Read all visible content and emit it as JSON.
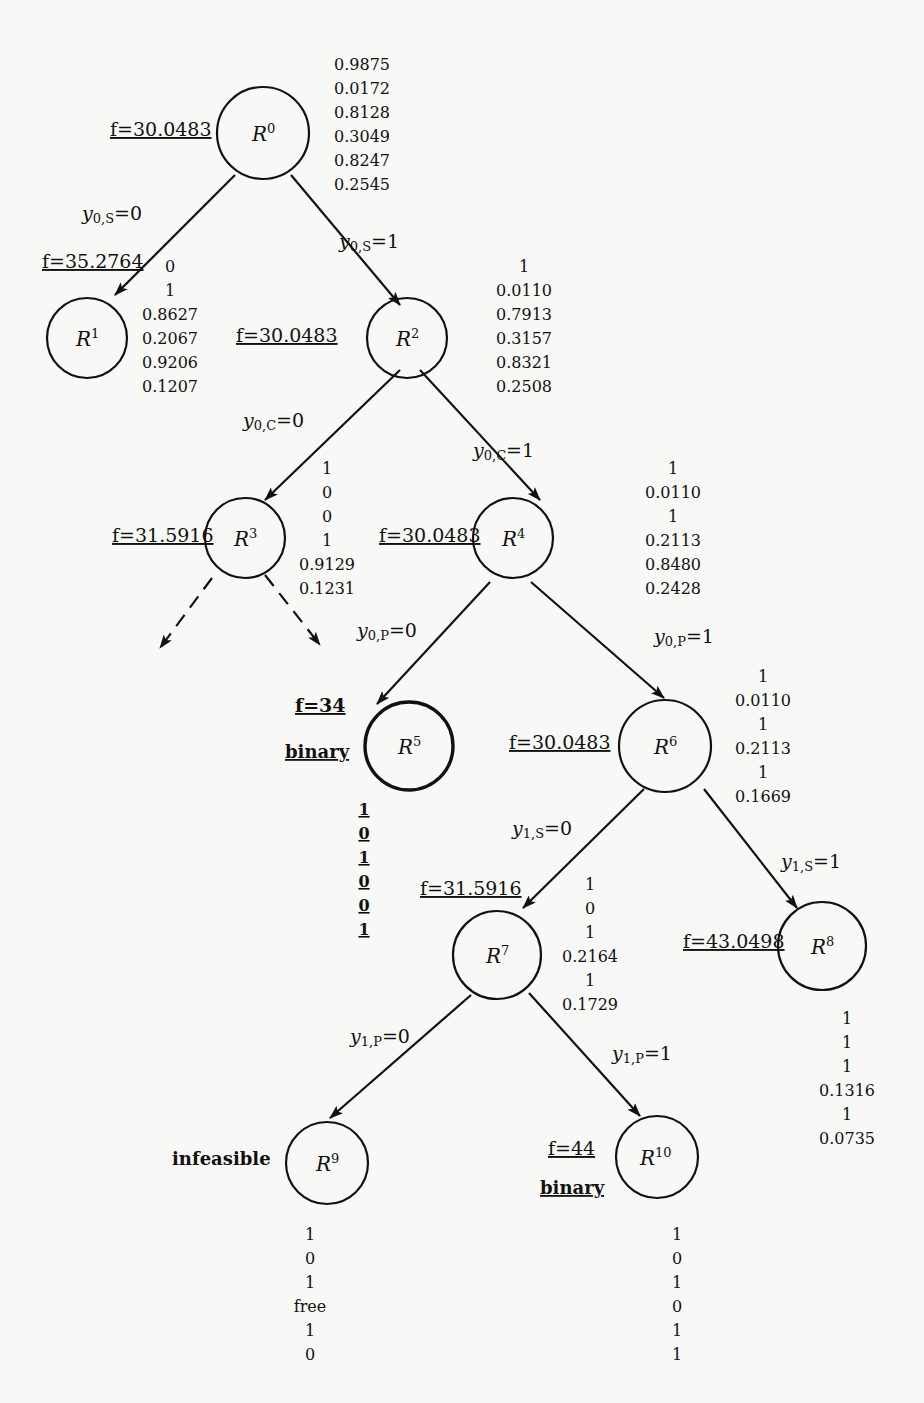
{
  "diagram": {
    "nodes": [
      {
        "id": "R0",
        "label": "R",
        "sup": "0",
        "f": "f=30.0483",
        "status": "",
        "values": [
          "0.9875",
          "0.0172",
          "0.8128",
          "0.3049",
          "0.8247",
          "0.2545"
        ]
      },
      {
        "id": "R1",
        "label": "R",
        "sup": "1",
        "f": "f=35.2764",
        "status": "",
        "values": [
          "0",
          "1",
          "0.8627",
          "0.2067",
          "0.9206",
          "0.1207"
        ]
      },
      {
        "id": "R2",
        "label": "R",
        "sup": "2",
        "f": "f=30.0483",
        "status": "",
        "values": [
          "1",
          "0.0110",
          "0.7913",
          "0.3157",
          "0.8321",
          "0.2508"
        ]
      },
      {
        "id": "R3",
        "label": "R",
        "sup": "3",
        "f": "f=31.5916",
        "status": "",
        "values": [
          "1",
          "0",
          "0",
          "1",
          "0.9129",
          "0.1231"
        ]
      },
      {
        "id": "R4",
        "label": "R",
        "sup": "4",
        "f": "f=30.0483",
        "status": "",
        "values": [
          "1",
          "0.0110",
          "1",
          "0.2113",
          "0.8480",
          "0.2428"
        ]
      },
      {
        "id": "R5",
        "label": "R",
        "sup": "5",
        "f": "f=34",
        "status": "binary",
        "values": [
          "1",
          "0",
          "1",
          "0",
          "0",
          "1"
        ]
      },
      {
        "id": "R6",
        "label": "R",
        "sup": "6",
        "f": "f=30.0483",
        "status": "",
        "values": [
          "1",
          "0.0110",
          "1",
          "0.2113",
          "1",
          "0.1669"
        ]
      },
      {
        "id": "R7",
        "label": "R",
        "sup": "7",
        "f": "f=31.5916",
        "status": "",
        "values": [
          "1",
          "0",
          "1",
          "0.2164",
          "1",
          "0.1729"
        ]
      },
      {
        "id": "R8",
        "label": "R",
        "sup": "8",
        "f": "f=43.0498",
        "status": "",
        "values": [
          "1",
          "1",
          "1",
          "0.1316",
          "1",
          "0.0735"
        ]
      },
      {
        "id": "R9",
        "label": "R",
        "sup": "9",
        "f": "",
        "status": "infeasible",
        "values": [
          "1",
          "0",
          "1",
          "free",
          "1",
          "0"
        ]
      },
      {
        "id": "R10",
        "label": "R",
        "sup": "10",
        "f": "f=44",
        "status": "binary",
        "values": [
          "1",
          "0",
          "1",
          "0",
          "1",
          "1"
        ]
      }
    ],
    "edges": [
      {
        "from": "R0",
        "to": "R1",
        "var": "y",
        "sub": "0,S",
        "value": "=0"
      },
      {
        "from": "R0",
        "to": "R2",
        "var": "y",
        "sub": "0,S",
        "value": "=1"
      },
      {
        "from": "R2",
        "to": "R3",
        "var": "y",
        "sub": "0,C",
        "value": "=0"
      },
      {
        "from": "R2",
        "to": "R4",
        "var": "y",
        "sub": "0,C",
        "value": "=1"
      },
      {
        "from": "R4",
        "to": "R5",
        "var": "y",
        "sub": "0,P",
        "value": "=0"
      },
      {
        "from": "R4",
        "to": "R6",
        "var": "y",
        "sub": "0,P",
        "value": "=1"
      },
      {
        "from": "R6",
        "to": "R7",
        "var": "y",
        "sub": "1,S",
        "value": "=0"
      },
      {
        "from": "R6",
        "to": "R8",
        "var": "y",
        "sub": "1,S",
        "value": "=1"
      },
      {
        "from": "R7",
        "to": "R9",
        "var": "y",
        "sub": "1,P",
        "value": "=0"
      },
      {
        "from": "R7",
        "to": "R10",
        "var": "y",
        "sub": "1,P",
        "value": "=1"
      }
    ]
  }
}
